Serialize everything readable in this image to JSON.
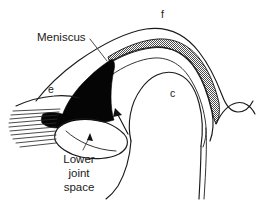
{
  "figure": {
    "background_color": "#ffffff",
    "ink_color": "#1a1a1a",
    "meniscus_fill_color": "#050505",
    "disc_band_fill": "#808080",
    "width": 272,
    "height": 203
  },
  "labels": {
    "meniscus": "Meniscus",
    "lower_joint_space_line1": "Lower",
    "lower_joint_space_line2": "joint",
    "lower_joint_space_line3": "space",
    "letter_f": "f",
    "letter_c": "c",
    "letter_e": "e"
  },
  "annotations": [
    {
      "name": "meniscus-leader",
      "label": "Meniscus",
      "points_to": "black wedge-shaped meniscus"
    },
    {
      "name": "lower-joint-space-leader",
      "label": "Lower joint space",
      "points_to": "space beneath the condyle head"
    },
    {
      "name": "joint-space-arrow",
      "label": "",
      "points_to": "posterior band of meniscus"
    }
  ],
  "structures": {
    "fibers": {
      "name": "muscle-fiber-hatching",
      "line_count": 10
    },
    "solid_wedge": {
      "name": "meniscus-solid-wedge",
      "shading": "solid-black"
    },
    "stippled_band": {
      "name": "articular-disc-band",
      "shading": "stippled-gray"
    }
  }
}
